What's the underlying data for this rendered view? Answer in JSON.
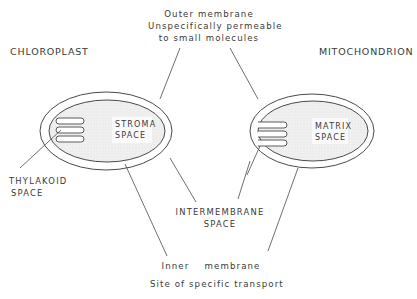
{
  "diagram": {
    "organelles": {
      "chloroplast": {
        "title": "CHLOROPLAST",
        "inner_space_line1": "STROMA",
        "inner_space_line2": "SPACE",
        "sub_space_line1": "THYLAKOID",
        "sub_space_line2": "SPACE"
      },
      "mitochondrion": {
        "title": "MITOCHONDRION",
        "inner_space_line1": "MATRIX",
        "inner_space_line2": "SPACE"
      }
    },
    "labels": {
      "outer_membrane": {
        "line1": "Outer membrane",
        "line2": "Unspecifically permeable",
        "line3": "to small molecules"
      },
      "intermembrane": {
        "line1": "INTERMEMBRANE",
        "line2": "SPACE"
      },
      "inner_membrane": {
        "line1": "Inner    membrane",
        "line2": "Site of specific transport"
      }
    },
    "colors": {
      "stroke": "#4a4a4a",
      "inner_fill": "#ececec",
      "text": "#3a3a3a"
    }
  }
}
